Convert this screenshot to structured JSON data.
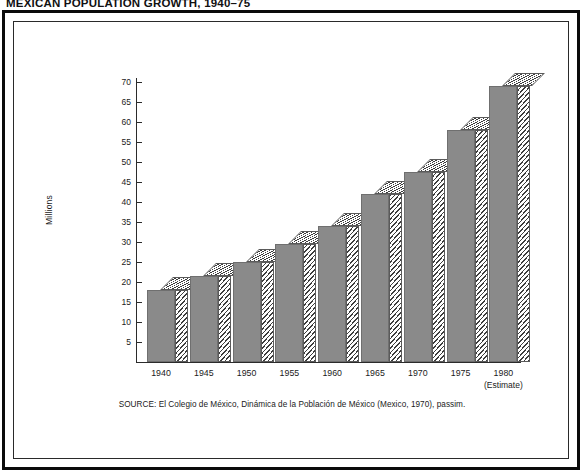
{
  "chart_data": {
    "type": "bar",
    "title": "MEXICAN POPULATION GROWTH, 1940–75",
    "xlabel": "",
    "ylabel": "Millions",
    "ylim": [
      0,
      72
    ],
    "grid": false,
    "legend": "none",
    "categories": [
      "1940",
      "1945",
      "1950",
      "1955",
      "1960",
      "1965",
      "1970",
      "1975",
      "1980"
    ],
    "values": [
      18,
      21.5,
      25,
      29.5,
      34,
      42,
      47.5,
      58,
      69
    ],
    "ytick_labels": [
      "5",
      "10",
      "15",
      "20",
      "25",
      "30",
      "35",
      "40",
      "45",
      "50",
      "55",
      "60",
      "65",
      "70"
    ],
    "ytick_values": [
      5,
      10,
      15,
      20,
      25,
      30,
      35,
      40,
      45,
      50,
      55,
      60,
      65,
      70
    ],
    "annotations": [
      "(Estimate)"
    ],
    "estimate_category": "1980",
    "source": "SOURCE: El Colegio de México, Dinámica de la Población de México (Mexico, 1970), passim.",
    "colors": {
      "bar_face": "#8a8a8a",
      "bar_hatch": "#3d3d3d",
      "axis": "#2b2b2b",
      "frame": "#0b0b0b",
      "background": "#ffffff"
    }
  },
  "figure": {
    "title": "MEXICAN POPULATION GROWTH, 1940–75",
    "y_axis_title": "Millions",
    "estimate_note": "(Estimate)",
    "source": "SOURCE: El Colegio de México, Dinámica de la Población de México (Mexico, 1970), passim."
  }
}
